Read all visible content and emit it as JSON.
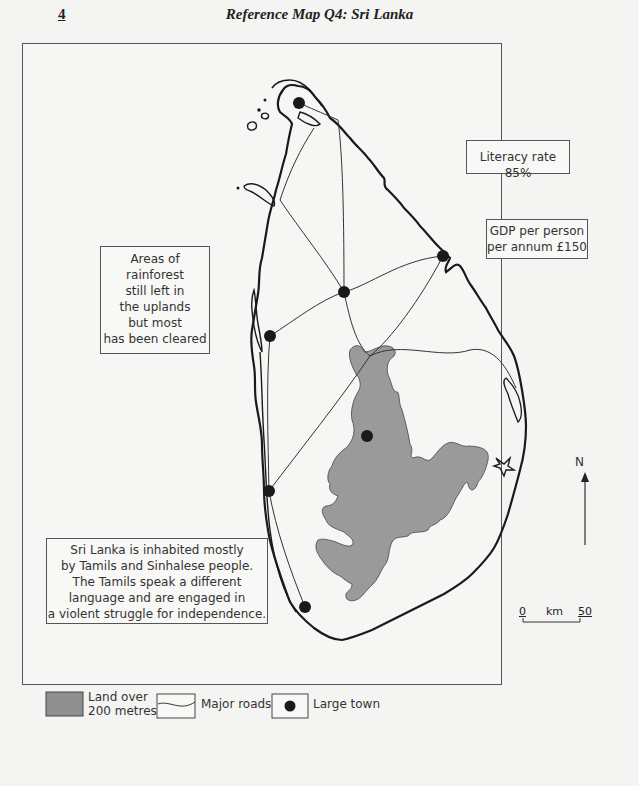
{
  "header": {
    "page_number": "4",
    "title": "Reference Map Q4: Sri Lanka"
  },
  "notes": {
    "literacy": "Literacy rate 85%",
    "gdp": [
      "GDP per person",
      "per annum £150"
    ],
    "rainforest": [
      "Areas of",
      "rainforest",
      "still left in",
      "the uplands",
      "but most",
      "has been cleared"
    ],
    "people": [
      "Sri Lanka is inhabited mostly",
      "by Tamils and Sinhalese people.",
      "The Tamils speak a different",
      "language and are engaged in",
      "a violent struggle for independence."
    ]
  },
  "compass": {
    "label": "N"
  },
  "scale_bar": {
    "start": "0",
    "unit": "km",
    "end": "50"
  },
  "legend": {
    "highland": {
      "label_line1": "Land over",
      "label_line2": "200 metres",
      "color": "#9a9a9a"
    },
    "roads": {
      "label": "Major roads"
    },
    "town": {
      "label": "Large town",
      "color": "#1a1a1a"
    }
  },
  "colors": {
    "coastline": "#1a1a1a",
    "road": "#333333",
    "highland_fill": "#9a9a9a",
    "frame": "#555555",
    "background": "#f4f4f2"
  },
  "towns": [
    {
      "name": "town-jaffna",
      "x": 299,
      "y": 103
    },
    {
      "name": "town-trincomalee",
      "x": 443,
      "y": 256
    },
    {
      "name": "town-anuradhapura",
      "x": 344,
      "y": 292
    },
    {
      "name": "town-puttalam",
      "x": 270,
      "y": 336
    },
    {
      "name": "town-kandy",
      "x": 367,
      "y": 436
    },
    {
      "name": "town-colombo",
      "x": 269,
      "y": 491
    },
    {
      "name": "town-galle",
      "x": 305,
      "y": 607
    }
  ]
}
